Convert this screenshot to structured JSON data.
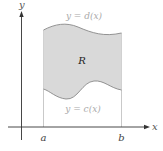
{
  "figure": {
    "axes": {
      "x_label": "x",
      "y_label": "y",
      "color": "#333333"
    },
    "region": {
      "label": "R",
      "fill": "#d9d9d9",
      "stroke": "#777777"
    },
    "curves": {
      "top_label": "y = d(x)",
      "bottom_label": "y = c(x)",
      "label_color": "#aaaaaa"
    },
    "bounds": {
      "left_label": "a",
      "right_label": "b",
      "guide_color": "#bbbbbb"
    }
  }
}
